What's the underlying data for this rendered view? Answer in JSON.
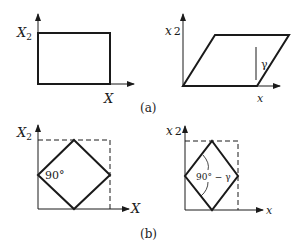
{
  "figure": {
    "panel_a": {
      "caption": "(a)",
      "left": {
        "y_axis_label": "X",
        "y_axis_sub": "2",
        "x_axis_label": "X",
        "shape": "rectangle"
      },
      "right": {
        "y_axis_label": "x",
        "y_axis_sub": "2",
        "x_axis_label": "x",
        "shape": "parallelogram",
        "shear_label": "γ"
      }
    },
    "panel_b": {
      "caption": "(b)",
      "left": {
        "y_axis_label": "X",
        "y_axis_sub": "2",
        "x_axis_label": "X",
        "shape": "square-diamond",
        "angle_label": "90°"
      },
      "right": {
        "y_axis_label": "x",
        "y_axis_sub": "2",
        "x_axis_label": "x",
        "shape": "rhombus",
        "angle_label": "90° − γ"
      }
    }
  },
  "colors": {
    "stroke": "#1a1a1a",
    "background": "#ffffff"
  }
}
